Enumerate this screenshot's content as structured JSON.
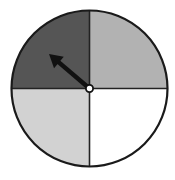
{
  "spinner": {
    "center": [
      89.5,
      88.5
    ],
    "radius": 78,
    "sections": [
      {
        "name": "top-left",
        "color": "#555555"
      },
      {
        "name": "top-right",
        "color": "#b2b2b2"
      },
      {
        "name": "bottom-left",
        "color": "#d2d2d2"
      },
      {
        "name": "bottom-right",
        "color": "#ffffff"
      }
    ],
    "arrow": {
      "points_to": "top-left",
      "tip": [
        49,
        54
      ]
    },
    "outline_color": "#1a1a1a"
  }
}
